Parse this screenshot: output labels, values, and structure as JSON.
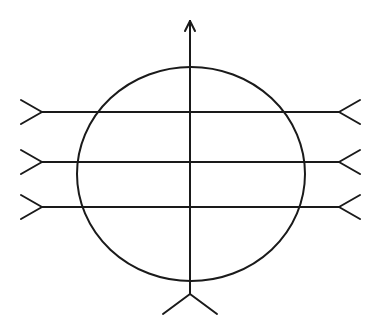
{
  "diagram": {
    "stroke_color": "#1a1a1a",
    "background": "#ffffff",
    "circle": {
      "cx": 191,
      "cy": 174,
      "rx": 114,
      "ry": 107
    },
    "vertical_arrow": {
      "x": 190,
      "y_top": 21,
      "y_bottom": 294,
      "head_width": 5,
      "head_length": 10,
      "fletch": {
        "dx": 27,
        "dy": 20
      }
    },
    "horizontal_lines": [
      {
        "y": 112,
        "x_left": 42,
        "x_right": 339
      },
      {
        "y": 162,
        "x_left": 42,
        "x_right": 339
      },
      {
        "y": 207,
        "x_left": 42,
        "x_right": 339
      }
    ],
    "fletch": {
      "dx": 21,
      "dy": 12
    }
  }
}
